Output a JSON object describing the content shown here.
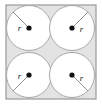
{
  "figure": {
    "type": "geometry-diagram",
    "canvas": {
      "width": 102,
      "height": 106
    },
    "colors": {
      "page_background": "#ffffff",
      "square_fill": "#e3e3e3",
      "square_stroke": "#9a9a9a",
      "circle_fill": "#ffffff",
      "circle_stroke": "#a8a8a8",
      "radius_line": "#8f8f8f",
      "center_dot": "#111111",
      "label_text": "#1a1a1a"
    },
    "square": {
      "label": "bounding-square",
      "x": 6,
      "y": 5,
      "width": 90,
      "height": 94,
      "stroke_width": 1.2
    },
    "circles": [
      {
        "id": "circle-top-left",
        "position": "top-left",
        "cx": 29,
        "cy": 28,
        "r": 22.5,
        "stroke_width": 1,
        "center_dot_r": 2.6,
        "radius_line": {
          "x1": 29,
          "y1": 28,
          "x2": 13.1,
          "y2": 12.1,
          "angle_deg": 225
        },
        "label": {
          "text": "r",
          "x": 19.5,
          "y": 30.5
        }
      },
      {
        "id": "circle-top-right",
        "position": "top-right",
        "cx": 72,
        "cy": 28,
        "r": 22.5,
        "stroke_width": 1,
        "center_dot_r": 2.6,
        "radius_line": {
          "x1": 72,
          "y1": 28,
          "x2": 87.9,
          "y2": 12.1,
          "angle_deg": 315
        },
        "label": {
          "text": "r",
          "x": 81.5,
          "y": 31.5
        }
      },
      {
        "id": "circle-bottom-left",
        "position": "bottom-left",
        "cx": 29,
        "cy": 75,
        "r": 22.5,
        "stroke_width": 1,
        "center_dot_r": 2.6,
        "radius_line": {
          "x1": 29,
          "y1": 75,
          "x2": 13.1,
          "y2": 90.9,
          "angle_deg": 135
        },
        "label": {
          "text": "r",
          "x": 19.5,
          "y": 78.5
        }
      },
      {
        "id": "circle-bottom-right",
        "position": "bottom-right",
        "cx": 72,
        "cy": 75,
        "r": 22.5,
        "stroke_width": 1,
        "center_dot_r": 2.6,
        "radius_line": {
          "x1": 72,
          "y1": 75,
          "x2": 87.9,
          "y2": 90.9,
          "angle_deg": 45
        },
        "label": {
          "text": "r",
          "x": 81.5,
          "y": 80.5
        }
      }
    ]
  }
}
